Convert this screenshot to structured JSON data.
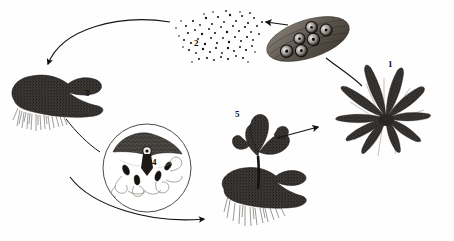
{
  "diagram": {
    "background_color": "#fefefe",
    "ink_color": "#1a1a1a",
    "width": 454,
    "height": 241,
    "labels": [
      {
        "key": "mature-sporophyte",
        "text": "1",
        "x": 388,
        "y": 64,
        "描述": "mature fern plant"
      },
      {
        "key": "spores",
        "text": "2",
        "x": 194,
        "y": 38,
        "描述": "released spores"
      },
      {
        "key": "gametophyte",
        "text": "3",
        "x": 85,
        "y": 90,
        "описание": "heart-shaped prothallus"
      },
      {
        "key": "fertilization-inset",
        "text": "4",
        "x": 152,
        "y": 159,
        "描述": "antheridia and archegonia detail"
      },
      {
        "key": "young-sporophyte",
        "text": "5",
        "x": 235,
        "y": 112,
        "描述": "young sporophyte on gametophyte"
      }
    ],
    "structures": [
      {
        "key": "sorus-pinnule",
        "name": "leaf segment bearing sori",
        "sori_count": 6
      },
      {
        "key": "spore-cloud",
        "name": "spore cloud",
        "spore_count": 95
      },
      {
        "key": "gametophyte-prothallus",
        "name": "heart-shaped gametophyte with rhizoids"
      },
      {
        "key": "fertilization-circle-inset",
        "name": "magnified circular inset with sperm and egg"
      },
      {
        "key": "young-sporophyte-plant",
        "name": "young fern frond rising from gametophyte"
      },
      {
        "key": "mature-fern",
        "name": "mature fern rosette of fronds"
      }
    ],
    "arrows": [
      {
        "key": "spores-to-gametophyte",
        "style": "curved",
        "from": "spore-cloud",
        "to": "gametophyte-prothallus",
        "arrowhead": true
      },
      {
        "key": "sorus-to-spores",
        "style": "straight",
        "from": "sorus-pinnule",
        "to": "spore-cloud",
        "arrowhead": true
      },
      {
        "key": "fern-to-sorus",
        "style": "curved",
        "from": "mature-fern",
        "to": "sorus-pinnule",
        "arrowhead": false
      },
      {
        "key": "gametophyte-to-inset",
        "style": "curved",
        "from": "gametophyte-prothallus",
        "to": "fertilization-circle-inset",
        "arrowhead": false
      },
      {
        "key": "gametophyte-to-young-sporophyte",
        "style": "curved",
        "from": "gametophyte-prothallus",
        "to": "young-sporophyte-plant",
        "arrowhead": true
      },
      {
        "key": "young-sporophyte-to-fern",
        "style": "straight",
        "from": "young-sporophyte-plant",
        "to": "mature-fern",
        "arrowhead": true
      }
    ]
  }
}
